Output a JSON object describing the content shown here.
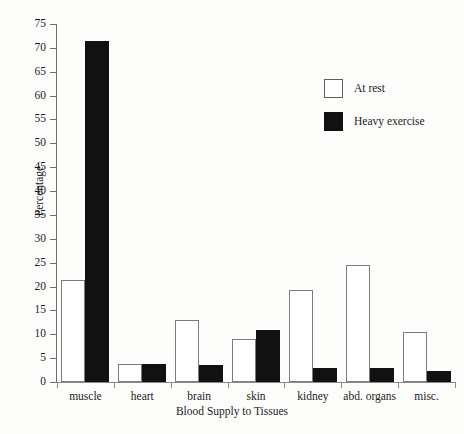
{
  "chart_data": {
    "type": "bar",
    "title": "",
    "xlabel": "Blood Supply to Tissues",
    "ylabel": "Percentage",
    "ylim": [
      0,
      75
    ],
    "ytick_step": 5,
    "yticks": [
      0,
      5,
      10,
      15,
      20,
      25,
      30,
      35,
      40,
      45,
      50,
      55,
      60,
      65,
      70,
      75
    ],
    "grid": false,
    "legend_position": "upper-right-inside",
    "categories": [
      "muscle",
      "heart",
      "brain",
      "skin",
      "kidney",
      "abd. organs",
      "misc."
    ],
    "series": [
      {
        "name": "At rest",
        "color": "#ffffff",
        "edge_color": "#7c7c7c",
        "values": [
          21.3,
          3.8,
          13.0,
          9.0,
          19.2,
          24.5,
          10.5
        ]
      },
      {
        "name": "Heavy exercise",
        "color": "#111111",
        "edge_color": "#111111",
        "values": [
          71.5,
          3.8,
          3.5,
          11.0,
          3.0,
          3.0,
          2.3
        ]
      }
    ]
  },
  "legend": {
    "items": [
      {
        "label": "At rest",
        "swatch": "rest"
      },
      {
        "label": "Heavy exercise",
        "swatch": "exercise"
      }
    ]
  },
  "axes": {
    "y_title": "Percentage",
    "x_title": "Blood Supply to Tissues"
  }
}
